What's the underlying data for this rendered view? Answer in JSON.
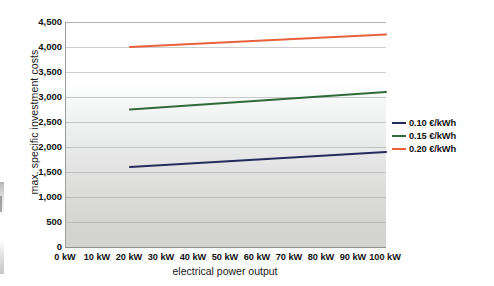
{
  "chart_data": {
    "type": "line",
    "title": "",
    "xlabel": "electrical power output",
    "ylabel": "max. specific investment costs",
    "x": [
      20,
      100
    ],
    "xlim": [
      0,
      100
    ],
    "ylim": [
      0,
      4500
    ],
    "x_tick_labels": [
      "0 kW",
      "10 kW",
      "20 kW",
      "30 kW",
      "40 kW",
      "50 kW",
      "60 kW",
      "70 kW",
      "80 kW",
      "90 kW",
      "100 kW"
    ],
    "x_tick_values": [
      0,
      10,
      20,
      30,
      40,
      50,
      60,
      70,
      80,
      90,
      100
    ],
    "y_tick_labels": [
      "0",
      "500",
      "1,000",
      "1,500",
      "2,000",
      "2,500",
      "3,000",
      "3,500",
      "4,000",
      "4,500"
    ],
    "y_tick_values": [
      0,
      500,
      1000,
      1500,
      2000,
      2500,
      3000,
      3500,
      4000,
      4500
    ],
    "grid": true,
    "legend_position": "right",
    "series": [
      {
        "name": "0.10 €/kWh",
        "color": "#262b5e",
        "x": [
          20,
          100
        ],
        "values": [
          1600,
          1900
        ]
      },
      {
        "name": "0.15 €/kWh",
        "color": "#2e6b38",
        "x": [
          20,
          100
        ],
        "values": [
          2750,
          3100
        ]
      },
      {
        "name": "0.20 €/kWh",
        "color": "#e8613c",
        "x": [
          20,
          100
        ],
        "values": [
          4000,
          4250
        ]
      }
    ]
  },
  "legend": {
    "items": [
      {
        "label": "0.10 €/kWh",
        "color": "#262b5e"
      },
      {
        "label": "0.15 €/kWh",
        "color": "#2e6b38"
      },
      {
        "label": "0.20 €/kWh",
        "color": "#e8613c"
      }
    ]
  }
}
